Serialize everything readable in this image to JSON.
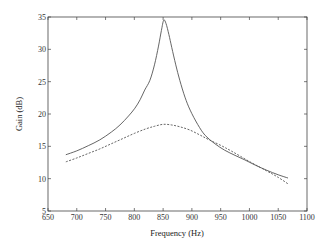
{
  "chart_data": {
    "type": "line",
    "title": "",
    "xlabel": "Frequency (Hz)",
    "ylabel": "Gain (dB)",
    "xlim": [
      650,
      1100
    ],
    "ylim": [
      5,
      35
    ],
    "xticks": [
      650,
      700,
      750,
      800,
      850,
      900,
      950,
      1000,
      1050,
      1100
    ],
    "yticks": [
      5,
      10,
      15,
      20,
      25,
      30,
      35
    ],
    "grid": false,
    "legend": null,
    "series": [
      {
        "name": "solid",
        "style": "solid",
        "color": "#555555",
        "x": [
          681,
          700,
          720,
          740,
          760,
          775,
          790,
          801,
          810,
          818,
          827,
          835,
          842,
          847,
          851,
          855,
          860,
          865,
          872,
          879,
          888,
          897,
          910,
          923,
          940,
          957,
          975,
          992,
          1010,
          1030,
          1050,
          1067
        ],
        "y": [
          13.7,
          14.3,
          15.1,
          16.0,
          17.2,
          18.3,
          19.7,
          20.9,
          22.2,
          23.7,
          25.2,
          27.6,
          30.5,
          32.9,
          34.5,
          34.0,
          32.3,
          30.3,
          27.6,
          25.2,
          22.6,
          20.6,
          18.4,
          16.7,
          15.4,
          14.4,
          13.6,
          12.9,
          12.1,
          11.3,
          10.6,
          10.1
        ]
      },
      {
        "name": "dashed",
        "style": "dashed",
        "color": "#555555",
        "x": [
          681,
          700,
          720,
          740,
          760,
          780,
          800,
          820,
          835,
          850,
          865,
          880,
          897,
          915,
          930,
          949,
          970,
          1001,
          1030,
          1050,
          1067
        ],
        "y": [
          12.6,
          13.2,
          13.9,
          14.6,
          15.4,
          16.2,
          17.0,
          17.7,
          18.1,
          18.4,
          18.3,
          18.0,
          17.5,
          16.7,
          16.0,
          15.2,
          14.2,
          12.6,
          11.2,
          10.2,
          9.2
        ]
      }
    ]
  }
}
